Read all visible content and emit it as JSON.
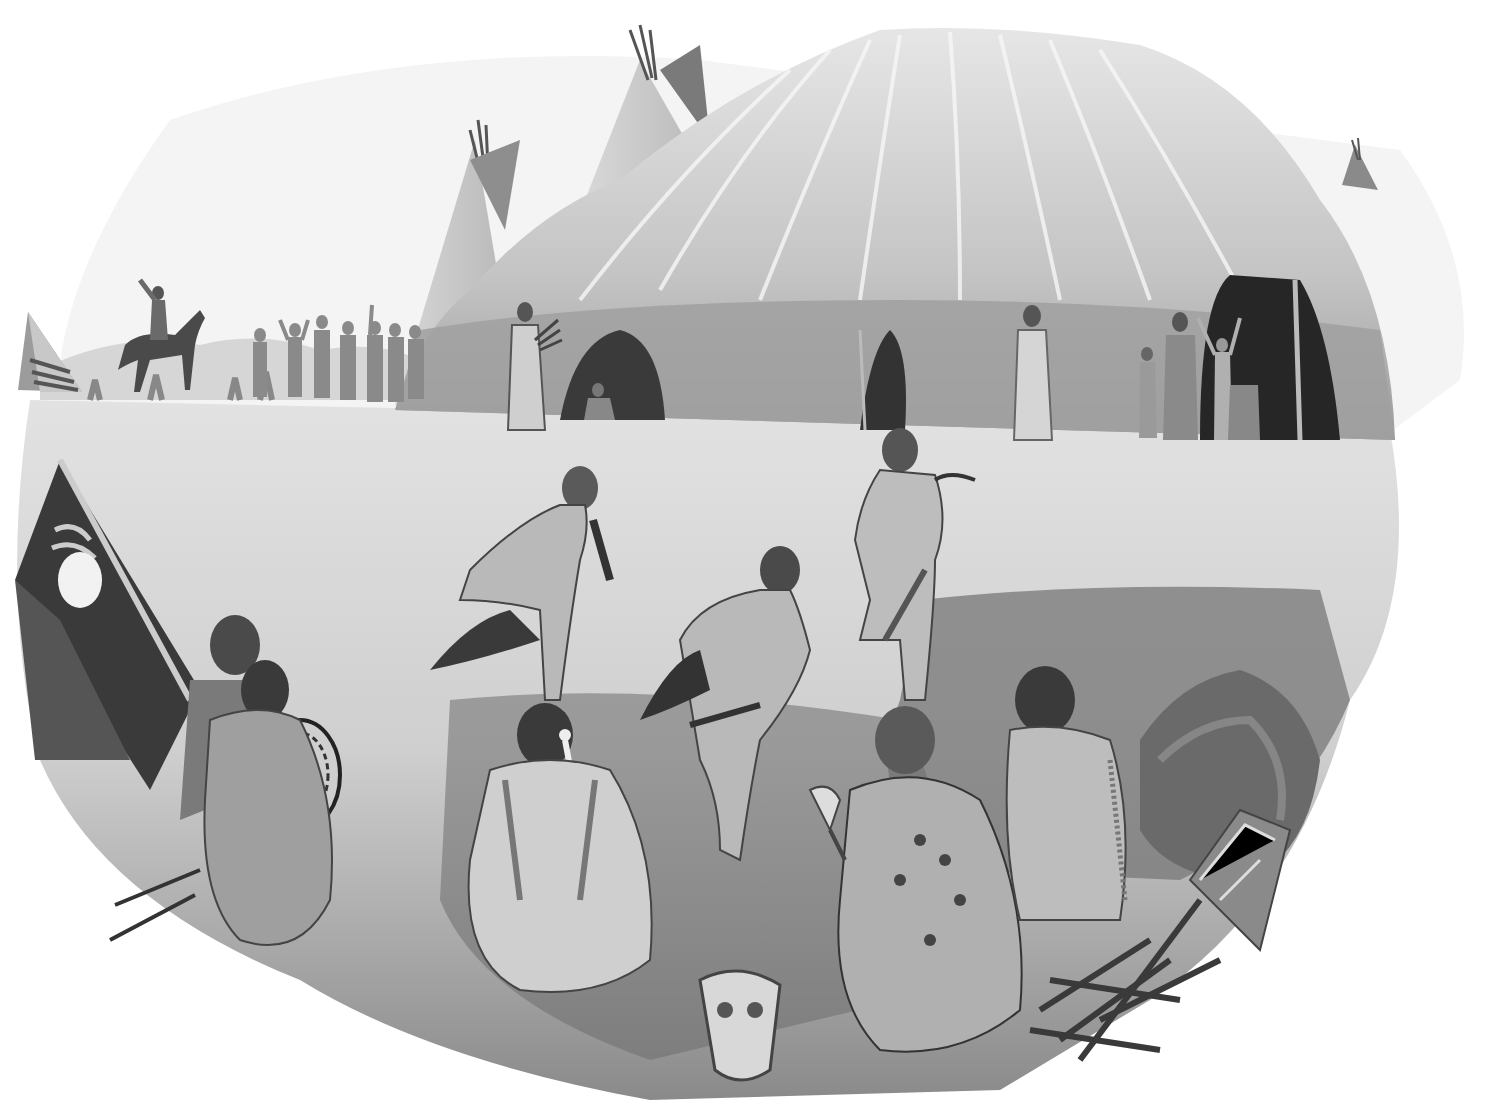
{
  "image": {
    "kind": "grayscale painted illustration",
    "subject": "ceremonial dance at a plains camp beside a large hide lodge",
    "palette": {
      "paper": "#ffffff",
      "sky": "#f2f2f2",
      "ground_light": "#d9d9d9",
      "ground_mid": "#9a9a9a",
      "shadow": "#5a5a5a",
      "dark": "#2a2a2a",
      "lodge_light": "#cfcfcf",
      "lodge_mid": "#a8a8a8",
      "lodge_dark": "#3c3c3c"
    }
  },
  "scene": {
    "background": {
      "tipis": [
        "left small tipi",
        "tipi behind lodge left",
        "tall tipi behind lodge",
        "distant tipi right"
      ],
      "rider": "rider on horse with raised arm",
      "crowd": "group of onlookers with raised arms"
    },
    "lodge": {
      "label": "large hide lodge",
      "doorways": 3,
      "figures_in_doorways": [
        "woman holding bundle",
        "seated figure",
        "standing woman",
        "children and adults waving"
      ]
    },
    "dancers": [
      "flute-playing dancer",
      "crouching dancer with stick",
      "dancer with staff"
    ],
    "foreground": {
      "seated_figures": [
        "man with drum",
        "man in blanket",
        "man with feather",
        "man with rattle in painted robe",
        "man in fringed shirt"
      ],
      "objects": [
        "painted shield/parfleche",
        "bison skull",
        "pile of sticks",
        "shrub"
      ]
    }
  }
}
